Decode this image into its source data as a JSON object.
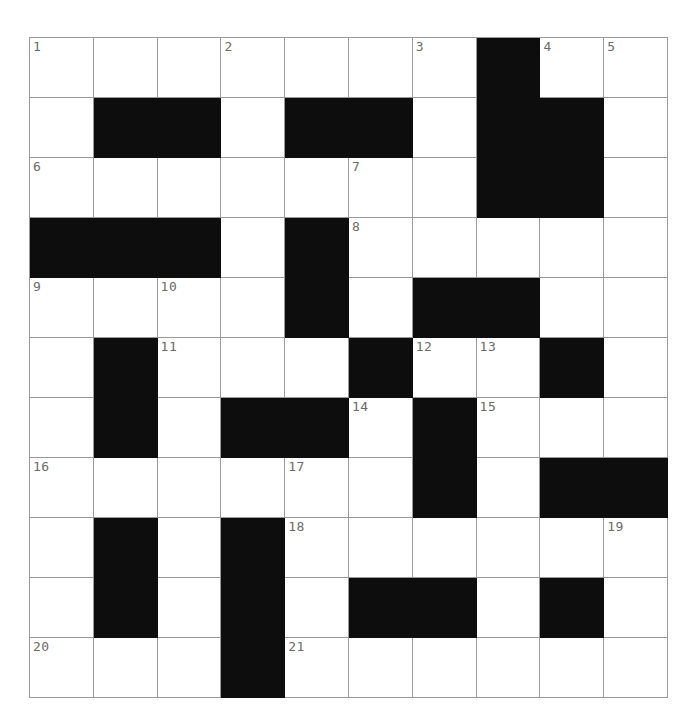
{
  "puzzle": {
    "type": "crossword-grid",
    "columns": 10,
    "rows": 11,
    "cell_width": 63.8,
    "cell_height": 60,
    "origin_x": 29,
    "origin_y": 37,
    "colors": {
      "background": "#ffffff",
      "grid_line": "#9a9a9a",
      "blocked_cell": "#0d0d0d",
      "number_text": "#6b6b6b"
    },
    "blocked_cells": [
      [
        0,
        7
      ],
      [
        1,
        1
      ],
      [
        1,
        2
      ],
      [
        1,
        4
      ],
      [
        1,
        5
      ],
      [
        1,
        7
      ],
      [
        1,
        8
      ],
      [
        2,
        7
      ],
      [
        2,
        8
      ],
      [
        3,
        0
      ],
      [
        3,
        1
      ],
      [
        3,
        2
      ],
      [
        3,
        4
      ],
      [
        4,
        4
      ],
      [
        4,
        6
      ],
      [
        4,
        7
      ],
      [
        5,
        1
      ],
      [
        5,
        5
      ],
      [
        5,
        8
      ],
      [
        6,
        1
      ],
      [
        6,
        3
      ],
      [
        6,
        4
      ],
      [
        6,
        6
      ],
      [
        7,
        6
      ],
      [
        7,
        8
      ],
      [
        7,
        9
      ],
      [
        8,
        1
      ],
      [
        8,
        3
      ],
      [
        9,
        1
      ],
      [
        9,
        3
      ],
      [
        9,
        5
      ],
      [
        9,
        6
      ],
      [
        9,
        8
      ],
      [
        10,
        3
      ]
    ],
    "numbered_cells": [
      {
        "row": 0,
        "col": 0,
        "number": "1"
      },
      {
        "row": 0,
        "col": 3,
        "number": "2"
      },
      {
        "row": 0,
        "col": 6,
        "number": "3"
      },
      {
        "row": 0,
        "col": 8,
        "number": "4"
      },
      {
        "row": 0,
        "col": 9,
        "number": "5"
      },
      {
        "row": 2,
        "col": 0,
        "number": "6"
      },
      {
        "row": 2,
        "col": 5,
        "number": "7"
      },
      {
        "row": 3,
        "col": 5,
        "number": "8"
      },
      {
        "row": 4,
        "col": 0,
        "number": "9"
      },
      {
        "row": 4,
        "col": 2,
        "number": "10"
      },
      {
        "row": 5,
        "col": 2,
        "number": "11"
      },
      {
        "row": 5,
        "col": 6,
        "number": "12"
      },
      {
        "row": 5,
        "col": 7,
        "number": "13"
      },
      {
        "row": 6,
        "col": 5,
        "number": "14"
      },
      {
        "row": 6,
        "col": 7,
        "number": "15"
      },
      {
        "row": 7,
        "col": 0,
        "number": "16"
      },
      {
        "row": 7,
        "col": 4,
        "number": "17"
      },
      {
        "row": 8,
        "col": 4,
        "number": "18"
      },
      {
        "row": 8,
        "col": 9,
        "number": "19"
      },
      {
        "row": 10,
        "col": 0,
        "number": "20"
      },
      {
        "row": 10,
        "col": 4,
        "number": "21"
      }
    ],
    "entries": []
  }
}
